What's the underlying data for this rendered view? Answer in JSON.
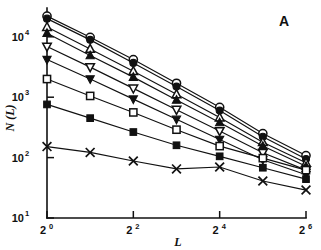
{
  "figure": {
    "panel_label": "A",
    "background_color": "#ffffff",
    "ink_color": "#111111"
  },
  "chart_data": {
    "type": "line",
    "title": "",
    "subtitle": "",
    "xlabel": "L",
    "ylabel": "N (L)",
    "xscale": "log2",
    "yscale": "log10",
    "xlim": [
      1,
      64
    ],
    "ylim": [
      10,
      30000
    ],
    "grid": false,
    "legend": "none",
    "annotations": [
      {
        "text": "A",
        "position": "top-right"
      }
    ],
    "x_tick_labels": [
      "2⁰",
      "2²",
      "2⁴",
      "2⁶"
    ],
    "x_tick_bases": [
      "2",
      "2",
      "2",
      "2"
    ],
    "x_tick_exponents": [
      "0",
      "2",
      "4",
      "6"
    ],
    "x_tick_values": [
      1,
      4,
      16,
      64
    ],
    "x_minor_tick_values": [
      2,
      8,
      32
    ],
    "y_tick_labels": [
      "10¹",
      "10²",
      "10³",
      "10⁴"
    ],
    "y_tick_bases": [
      "10",
      "10",
      "10",
      "10"
    ],
    "y_tick_exponents": [
      "1",
      "2",
      "3",
      "4"
    ],
    "y_tick_values": [
      10,
      100,
      1000,
      10000
    ],
    "x": [
      1,
      2,
      4,
      8,
      16,
      32,
      64
    ],
    "series": [
      {
        "name": "series-open-circle",
        "marker": "open-circle",
        "values": [
          22000,
          9800,
          4200,
          1700,
          680,
          250,
          108
        ]
      },
      {
        "name": "series-filled-circle",
        "marker": "filled-circle",
        "values": [
          20000,
          8900,
          3700,
          1500,
          600,
          222,
          95
        ]
      },
      {
        "name": "series-open-triangle-up",
        "marker": "open-triangle-up",
        "values": [
          14500,
          6300,
          2700,
          1120,
          460,
          180,
          82
        ]
      },
      {
        "name": "series-filled-triangle-up",
        "marker": "filled-triangle-up",
        "values": [
          11500,
          4900,
          2150,
          900,
          380,
          155,
          72
        ]
      },
      {
        "name": "series-open-triangle-down",
        "marker": "open-triangle-down",
        "values": [
          6900,
          3150,
          1400,
          620,
          275,
          120,
          62
        ]
      },
      {
        "name": "series-filled-triangle-down",
        "marker": "filled-triangle-down",
        "values": [
          4200,
          2000,
          930,
          430,
          200,
          92,
          52
        ]
      },
      {
        "name": "series-open-square",
        "marker": "open-square",
        "values": [
          2000,
          1050,
          560,
          290,
          155,
          98,
          62
        ]
      },
      {
        "name": "series-filled-square",
        "marker": "filled-square",
        "values": [
          760,
          450,
          265,
          160,
          105,
          68,
          44
        ]
      },
      {
        "name": "series-cross-x",
        "marker": "cross-x",
        "values": [
          152,
          122,
          88,
          65,
          70,
          41,
          29
        ]
      }
    ]
  }
}
